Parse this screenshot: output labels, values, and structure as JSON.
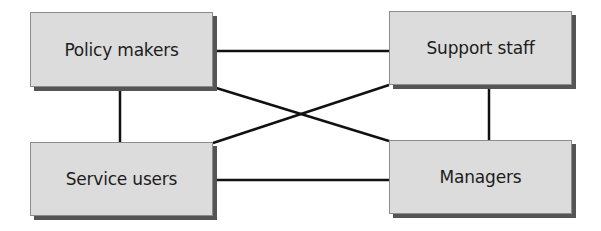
{
  "diagram": {
    "type": "relationship-network",
    "nodes": [
      {
        "id": "policy",
        "label": "Policy makers",
        "x": 30,
        "y": 12,
        "w": 183,
        "h": 75
      },
      {
        "id": "support",
        "label": "Support staff",
        "x": 389,
        "y": 11,
        "w": 183,
        "h": 74
      },
      {
        "id": "service",
        "label": "Service users",
        "x": 30,
        "y": 142,
        "w": 183,
        "h": 74
      },
      {
        "id": "managers",
        "label": "Managers",
        "x": 389,
        "y": 140,
        "w": 183,
        "h": 74
      }
    ],
    "edges": [
      {
        "from": "policy",
        "to": "support",
        "x1": 213,
        "y1": 51,
        "x2": 389,
        "y2": 51
      },
      {
        "from": "service",
        "to": "managers",
        "x1": 213,
        "y1": 180,
        "x2": 389,
        "y2": 180
      },
      {
        "from": "policy",
        "to": "service",
        "x1": 120,
        "y1": 87,
        "x2": 120,
        "y2": 142
      },
      {
        "from": "support",
        "to": "managers",
        "x1": 489,
        "y1": 85,
        "x2": 489,
        "y2": 140
      },
      {
        "from": "policy",
        "to": "managers",
        "x1": 213,
        "y1": 87,
        "x2": 389,
        "y2": 141
      },
      {
        "from": "service",
        "to": "support",
        "x1": 213,
        "y1": 143,
        "x2": 389,
        "y2": 85
      }
    ],
    "colors": {
      "box_fill": "#dcdcdc",
      "box_border": "#8c8c8c",
      "shadow": "#555555",
      "line": "#111111",
      "text": "#1c1c1c"
    }
  }
}
